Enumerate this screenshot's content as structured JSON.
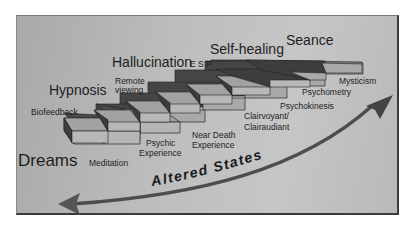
{
  "diagram": {
    "major_labels": {
      "dreams": "Dreams",
      "hypnosis": "Hypnosis",
      "hallucination": "Hallucination",
      "self_healing": "Self-healing",
      "seance": "Seance"
    },
    "step_labels": {
      "biofeedback": "Biofeedback",
      "meditation": "Meditation",
      "remote_viewing_1": "Remote",
      "remote_viewing_2": "viewing",
      "psychic_1": "Psychic",
      "psychic_2": "Experience",
      "esp": "E S P",
      "near_death_1": "Near Death",
      "near_death_2": "Experience",
      "clairvoyant_1": "Clairvoyant/",
      "clairvoyant_2": "Clairaudiant",
      "psychokinesis": "Psychokinesis",
      "psychometry": "Psychometry",
      "mysticism": "Mysticism"
    },
    "arrow_label": "Altered States",
    "colors": {
      "background": "#bcbcbc",
      "step_top": "#a6a6a6",
      "step_riser": "#4a4a4a",
      "step_front": "#b8b8b8",
      "arrow": "#4d4d4d",
      "text": "#1e1e1e"
    }
  }
}
